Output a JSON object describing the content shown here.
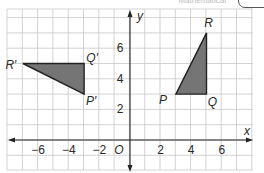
{
  "header": {
    "faded_text": "Mathematical"
  },
  "axes": {
    "x_label": "x",
    "y_label": "y",
    "origin_label": "O",
    "x_ticks": [
      {
        "value": -6,
        "label": "−6"
      },
      {
        "value": -4,
        "label": "−4"
      },
      {
        "value": -2,
        "label": "−2"
      },
      {
        "value": 2,
        "label": "2"
      },
      {
        "value": 4,
        "label": "4"
      },
      {
        "value": 6,
        "label": "6"
      }
    ],
    "y_ticks": [
      {
        "value": 2,
        "label": "2"
      },
      {
        "value": 4,
        "label": "4"
      },
      {
        "value": 6,
        "label": "6"
      }
    ],
    "x_range": [
      -8,
      8
    ],
    "y_range": [
      -1.5,
      8.5
    ]
  },
  "triangles": [
    {
      "name": "PQR",
      "fill": "#6e6e6e",
      "vertices": [
        {
          "label": "P",
          "x": 3,
          "y": 3
        },
        {
          "label": "Q",
          "x": 5,
          "y": 3
        },
        {
          "label": "R",
          "x": 5,
          "y": 7
        }
      ]
    },
    {
      "name": "P'Q'R'",
      "fill": "#6e6e6e",
      "vertices": [
        {
          "label": "P′",
          "x": -3,
          "y": 3
        },
        {
          "label": "Q′",
          "x": -3,
          "y": 5
        },
        {
          "label": "R′",
          "x": -7,
          "y": 5
        }
      ]
    }
  ],
  "colors": {
    "grid": "#c8c8c8",
    "axis": "#222222",
    "triangle_fill": "#6e6e6e",
    "triangle_stroke": "#222222"
  }
}
